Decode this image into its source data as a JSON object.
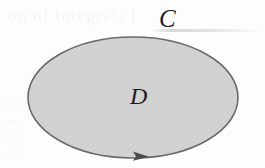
{
  "figure": {
    "kind": "math-region-diagram",
    "background_color": "#fdfdfd"
  },
  "region": {
    "label": "D",
    "shape": "ellipse",
    "fill_color": "#d4d4d4",
    "stroke_color": "#6a6a6a",
    "stroke_width": 1.6,
    "center_x": 133,
    "center_y": 97.5,
    "radius_x": 105,
    "radius_y": 60.5
  },
  "curve": {
    "label": "C",
    "orientation_marker": "arrowhead",
    "arrow_direction": "right",
    "arrow_position": "bottom-of-boundary",
    "arrow_color": "#4c4c4c",
    "arrow_x": 141,
    "arrow_y": 156
  },
  "labels": {
    "curve_label": "C",
    "region_label": "D"
  },
  "artifacts": {
    "ghost_text": "on of Integrals  I",
    "ghost_note": "faint scanner bleed-through from the facing page; illegible in the original",
    "smudge": "horizontal scan streak near the upper right"
  }
}
